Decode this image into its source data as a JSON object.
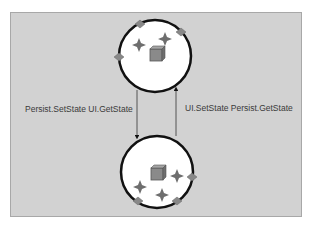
{
  "diagram": {
    "nodes": [
      {
        "id": "top",
        "label": "",
        "shape": "circle"
      },
      {
        "id": "bottom",
        "label": "",
        "shape": "circle"
      }
    ],
    "edges": [
      {
        "from": "top",
        "to": "bottom",
        "label": "Persist.SetState UI.GetState"
      },
      {
        "from": "bottom",
        "to": "top",
        "label": "UI.SetState Persist.GetState"
      }
    ]
  },
  "labels": {
    "left_arrow": "Persist.SetState UI.GetState",
    "right_arrow": "UI.SetState Persist.GetState"
  },
  "colors": {
    "background": "#d2d2d2",
    "circle_fill": "#ffffff",
    "circle_stroke": "#111111",
    "diamond": "#888888",
    "star": "#6e6e6e",
    "cube": "#8a8a8a"
  }
}
